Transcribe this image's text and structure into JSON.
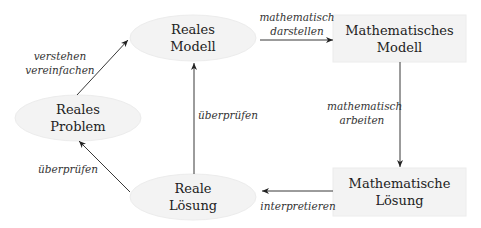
{
  "diagram": {
    "type": "modelling-cycle",
    "colors": {
      "node_fill": "#f3f3f3",
      "node_stroke": "#ececec",
      "edge": "#222222",
      "text": "#222222"
    },
    "nodes": [
      {
        "id": "reales_problem",
        "shape": "ellipse",
        "line1": "Reales",
        "line2": "Problem"
      },
      {
        "id": "reales_modell",
        "shape": "ellipse",
        "line1": "Reales",
        "line2": "Modell"
      },
      {
        "id": "math_modell",
        "shape": "rectangle",
        "line1": "Mathematisches",
        "line2": "Modell"
      },
      {
        "id": "math_loesung",
        "shape": "rectangle",
        "line1": "Mathematische",
        "line2": "Lösung"
      },
      {
        "id": "reale_loesung",
        "shape": "ellipse",
        "line1": "Reale",
        "line2": "Lösung"
      }
    ],
    "edges": [
      {
        "from": "reales_problem",
        "to": "reales_modell",
        "line1": "verstehen",
        "line2": "vereinfachen"
      },
      {
        "from": "reales_modell",
        "to": "math_modell",
        "line1": "mathematisch",
        "line2": "darstellen"
      },
      {
        "from": "math_modell",
        "to": "math_loesung",
        "line1": "mathematisch",
        "line2": "arbeiten"
      },
      {
        "from": "math_loesung",
        "to": "reale_loesung",
        "line1": "interpretieren"
      },
      {
        "from": "reale_loesung",
        "to": "reales_modell",
        "line1": "überprüfen"
      },
      {
        "from": "reale_loesung",
        "to": "reales_problem",
        "line1": "überprüfen"
      }
    ]
  }
}
